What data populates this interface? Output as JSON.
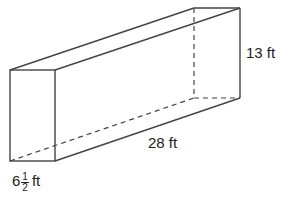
{
  "diagram": {
    "type": "rectangular-prism",
    "line_color": "#444444",
    "labels": {
      "height": "13 ft",
      "length": "28 ft",
      "width_whole": "6",
      "width_num": "1",
      "width_den": "2",
      "width_unit": "ft"
    }
  }
}
